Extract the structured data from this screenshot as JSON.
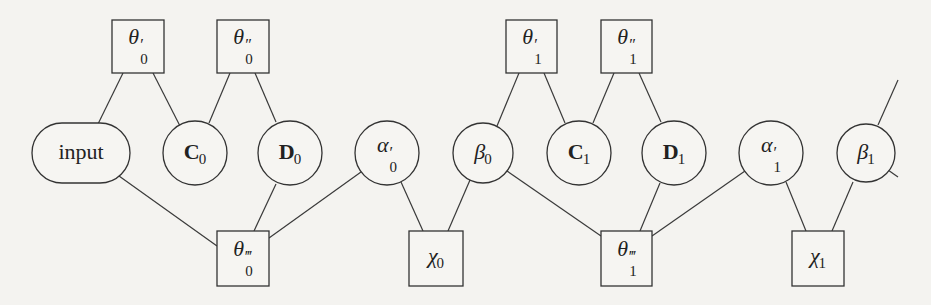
{
  "diagram": {
    "title": "",
    "background_color": "#f4f3f0",
    "stroke_color": "#333333",
    "nodes": [
      {
        "id": "theta1_0",
        "shape": "box",
        "symbol": "θ",
        "prime": "′",
        "sub": "0",
        "label": "θ′0"
      },
      {
        "id": "theta2_0",
        "shape": "box",
        "symbol": "θ",
        "prime": "″",
        "sub": "0",
        "label": "θ″0"
      },
      {
        "id": "input",
        "shape": "pill",
        "text": "input",
        "label": "input"
      },
      {
        "id": "C0",
        "shape": "circle",
        "symbol": "C",
        "sub": "0",
        "label": "C0"
      },
      {
        "id": "D0",
        "shape": "circle",
        "symbol": "D",
        "sub": "0",
        "label": "D0"
      },
      {
        "id": "alpha_0",
        "shape": "circle",
        "symbol": "α",
        "prime": "′",
        "sub": "0",
        "label": "α′0"
      },
      {
        "id": "theta3_0",
        "shape": "box",
        "symbol": "θ",
        "prime": "‴",
        "sub": "0",
        "label": "θ‴0"
      },
      {
        "id": "chi0",
        "shape": "box",
        "symbol": "χ",
        "sub": "0",
        "label": "χ0"
      },
      {
        "id": "beta0",
        "shape": "circle",
        "symbol": "β",
        "sub": "0",
        "label": "β0"
      },
      {
        "id": "theta1_1",
        "shape": "box",
        "symbol": "θ",
        "prime": "′",
        "sub": "1",
        "label": "θ′1"
      },
      {
        "id": "theta2_1",
        "shape": "box",
        "symbol": "θ",
        "prime": "″",
        "sub": "1",
        "label": "θ″1"
      },
      {
        "id": "C1",
        "shape": "circle",
        "symbol": "C",
        "sub": "1",
        "label": "C1"
      },
      {
        "id": "D1",
        "shape": "circle",
        "symbol": "D",
        "sub": "1",
        "label": "D1"
      },
      {
        "id": "alpha_1",
        "shape": "circle",
        "symbol": "α",
        "prime": "′",
        "sub": "1",
        "label": "α′1"
      },
      {
        "id": "beta1",
        "shape": "circle",
        "symbol": "β",
        "sub": "1",
        "label": "β1"
      },
      {
        "id": "theta3_1",
        "shape": "box",
        "symbol": "θ",
        "prime": "‴",
        "sub": "1",
        "label": "θ‴1"
      },
      {
        "id": "chi1",
        "shape": "box",
        "symbol": "χ",
        "sub": "1",
        "label": "χ1"
      }
    ],
    "edges": [
      [
        "theta1_0",
        "input"
      ],
      [
        "theta1_0",
        "C0"
      ],
      [
        "theta2_0",
        "C0"
      ],
      [
        "theta2_0",
        "D0"
      ],
      [
        "input",
        "theta3_0"
      ],
      [
        "D0",
        "theta3_0"
      ],
      [
        "alpha_0",
        "theta3_0"
      ],
      [
        "alpha_0",
        "chi0"
      ],
      [
        "beta0",
        "chi0"
      ],
      [
        "theta1_1",
        "beta0"
      ],
      [
        "theta1_1",
        "C1"
      ],
      [
        "theta2_1",
        "C1"
      ],
      [
        "theta2_1",
        "D1"
      ],
      [
        "beta0",
        "theta3_1"
      ],
      [
        "D1",
        "theta3_1"
      ],
      [
        "alpha_1",
        "theta3_1"
      ],
      [
        "alpha_1",
        "chi1"
      ],
      [
        "beta1",
        "chi1"
      ],
      [
        "beta1",
        "(continues up-right)"
      ],
      [
        "beta1",
        "(continues down-right)"
      ]
    ]
  }
}
